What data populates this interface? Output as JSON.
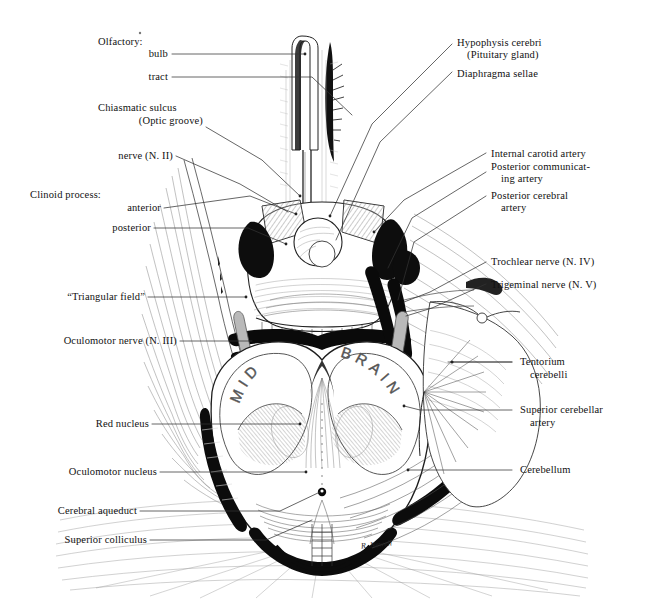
{
  "figure": {
    "signature": "R. Newell",
    "ink_color": "#111111",
    "paper_color": "#ffffff",
    "midbrain_text_left": "MID",
    "midbrain_text_right": "BRAIN"
  },
  "labels_left": [
    {
      "id": "olfactory-heading",
      "text": "Olfactory:"
    },
    {
      "id": "olfactory-bulb",
      "text": "bulb"
    },
    {
      "id": "olfactory-tract",
      "text": "tract"
    },
    {
      "id": "chiasmatic-sulcus-1",
      "text": "Chiasmatic sulcus"
    },
    {
      "id": "chiasmatic-sulcus-2",
      "text": "(Optic groove)"
    },
    {
      "id": "optic-nerve",
      "text": "nerve (N. II)"
    },
    {
      "id": "clinoid-heading",
      "text": "Clinoid process:"
    },
    {
      "id": "clinoid-anterior",
      "text": "anterior"
    },
    {
      "id": "clinoid-posterior",
      "text": "posterior"
    },
    {
      "id": "triangular-field",
      "text": "“Triangular field”"
    },
    {
      "id": "oculomotor-nerve",
      "text": "Oculomotor nerve (N. III)"
    },
    {
      "id": "red-nucleus",
      "text": "Red nucleus"
    },
    {
      "id": "oculomotor-nucleus",
      "text": "Oculomotor nucleus"
    },
    {
      "id": "cerebral-aqueduct",
      "text": "Cerebral aqueduct"
    },
    {
      "id": "superior-colliculus",
      "text": "Superior colliculus"
    }
  ],
  "labels_right": [
    {
      "id": "hypophysis-1",
      "text": "Hypophysis cerebri"
    },
    {
      "id": "hypophysis-2",
      "text": "(Pituitary gland)"
    },
    {
      "id": "diaphragma-sellae",
      "text": "Diaphragma sellae"
    },
    {
      "id": "internal-carotid-artery",
      "text": "Internal carotid artery"
    },
    {
      "id": "posterior-communicating-1",
      "text": "Posterior communicat-"
    },
    {
      "id": "posterior-communicating-2",
      "text": "ing artery"
    },
    {
      "id": "posterior-cerebral-1",
      "text": "Posterior cerebral"
    },
    {
      "id": "posterior-cerebral-2",
      "text": "artery"
    },
    {
      "id": "trochlear-nerve",
      "text": "Trochlear nerve (N. IV)"
    },
    {
      "id": "trigeminal-nerve",
      "text": "Trigeminal nerve (N. V)"
    },
    {
      "id": "tentorium-1",
      "text": "Tentorium"
    },
    {
      "id": "tentorium-2",
      "text": "cerebelli"
    },
    {
      "id": "superior-cerebellar-1",
      "text": "Superior cerebellar"
    },
    {
      "id": "superior-cerebellar-2",
      "text": "artery"
    },
    {
      "id": "cerebellum",
      "text": "Cerebellum"
    }
  ]
}
